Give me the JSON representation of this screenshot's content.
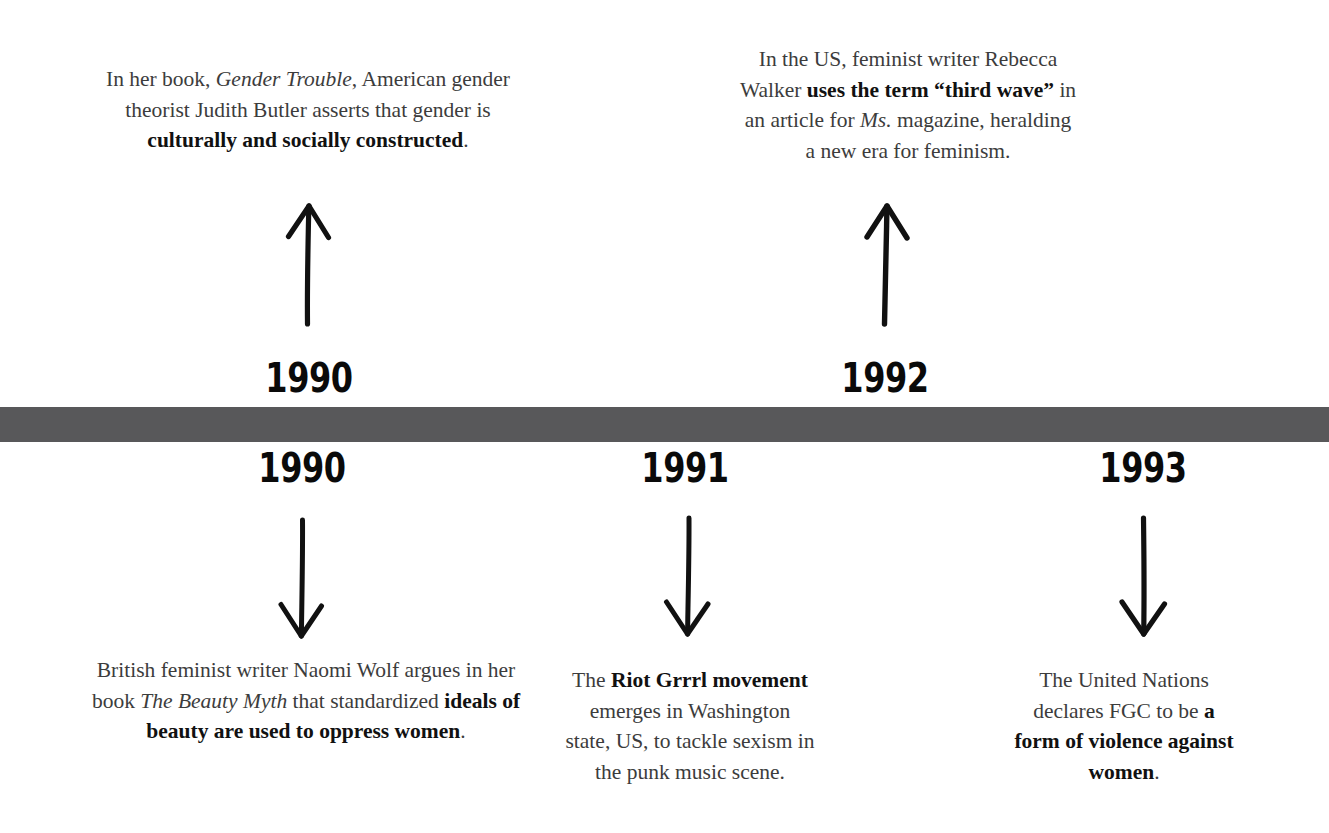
{
  "diagram": {
    "type": "timeline",
    "bar_color": "#58585a",
    "background_color": "#ffffff",
    "text_color": "#3c3c3c",
    "emphasis_color": "#111111"
  },
  "events_above": [
    {
      "year": "1990",
      "arrow": "up-arrow-icon",
      "text_html": "In her book, <i>Gender Trouble</i>, American gender theorist Judith Butler asserts that gender is <b>culturally and socially constructed</b>.",
      "text_plain": "In her book, Gender Trouble, American gender theorist Judith Butler asserts that gender is culturally and socially constructed."
    },
    {
      "year": "1992",
      "arrow": "up-arrow-icon",
      "text_html": "In the US, feminist writer Rebecca Walker <b>uses the term “third wave”</b> in an article for <i>Ms.</i> magazine, heralding a new era for feminism.",
      "text_plain": "In the US, feminist writer Rebecca Walker uses the term “third wave” in an article for Ms. magazine, heralding a new era for feminism."
    }
  ],
  "events_below": [
    {
      "year": "1990",
      "arrow": "down-arrow-icon",
      "text_html": "British feminist writer Naomi Wolf argues in her book <i>The Beauty Myth</i> that standardized <b>ideals of beauty are used to oppress women</b>.",
      "text_plain": "British feminist writer Naomi Wolf argues in her book The Beauty Myth that standardized ideals of beauty are used to oppress women."
    },
    {
      "year": "1991",
      "arrow": "down-arrow-icon",
      "text_html": "The <b>Riot Grrrl movement</b> emerges in Washington state, US, to tackle sexism in the punk music scene.",
      "text_plain": "The Riot Grrrl movement emerges in Washington state, US, to tackle sexism in the punk music scene."
    },
    {
      "year": "1993",
      "arrow": "down-arrow-icon",
      "text_html": "The United Nations declares FGC to be <b>a form of violence against women</b>.",
      "text_plain": "The United Nations declares FGC to be a form of violence against women."
    }
  ]
}
